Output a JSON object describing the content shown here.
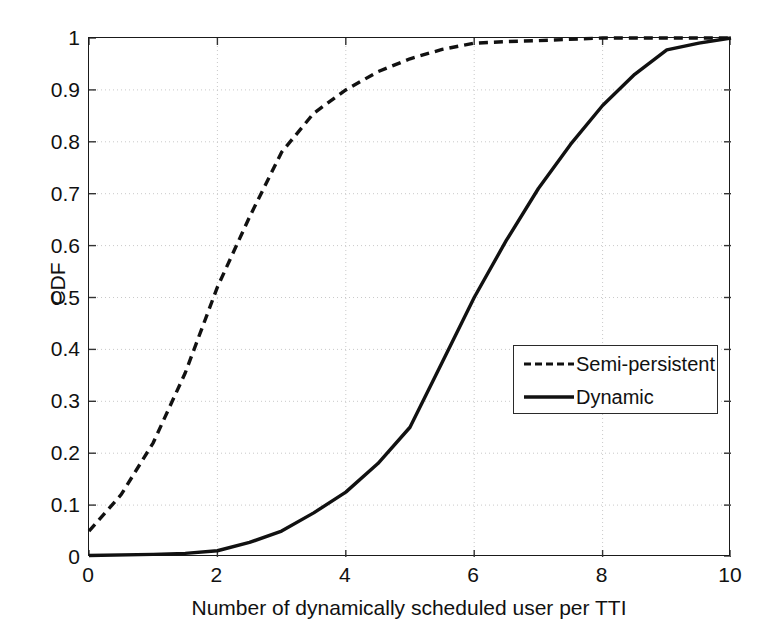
{
  "chart_data": {
    "type": "line",
    "title": "",
    "xlabel": "Number of dynamically scheduled user per TTI",
    "ylabel": "CDF",
    "xlim": [
      0,
      10
    ],
    "ylim": [
      0,
      1
    ],
    "grid": true,
    "grid_style": "dotted",
    "legend_position": "center-right",
    "xticks": [
      "0",
      "2",
      "4",
      "6",
      "8",
      "10"
    ],
    "xtick_values": [
      0,
      2,
      4,
      6,
      8,
      10
    ],
    "yticks": [
      "0",
      "0.1",
      "0.2",
      "0.3",
      "0.4",
      "0.5",
      "0.6",
      "0.7",
      "0.8",
      "0.9",
      "1"
    ],
    "ytick_values": [
      0,
      0.1,
      0.2,
      0.3,
      0.4,
      0.5,
      0.6,
      0.7,
      0.8,
      0.9,
      1.0
    ],
    "series": [
      {
        "name": "Semi-persistent",
        "style": "dashed",
        "color": "#111111",
        "x": [
          0,
          0.5,
          1,
          1.5,
          2,
          2.5,
          3,
          3.5,
          4,
          4.5,
          5,
          5.5,
          6,
          6.5,
          7,
          8,
          9,
          10
        ],
        "values": [
          0.05,
          0.12,
          0.22,
          0.355,
          0.52,
          0.655,
          0.78,
          0.855,
          0.9,
          0.935,
          0.96,
          0.978,
          0.99,
          0.993,
          0.995,
          1.0,
          1.0,
          1.0
        ]
      },
      {
        "name": "Dynamic",
        "style": "solid",
        "color": "#111111",
        "x": [
          0,
          1,
          1.5,
          2,
          2.5,
          3,
          3.5,
          4,
          4.5,
          5,
          5.5,
          6,
          6.5,
          7,
          7.5,
          8,
          8.5,
          9,
          9.5,
          10
        ],
        "values": [
          0.003,
          0.005,
          0.007,
          0.012,
          0.028,
          0.05,
          0.085,
          0.125,
          0.18,
          0.25,
          0.375,
          0.5,
          0.61,
          0.71,
          0.795,
          0.87,
          0.93,
          0.977,
          0.99,
          1.0
        ]
      }
    ]
  },
  "legend": {
    "items": [
      {
        "label": "Semi-persistent",
        "style": "dashed"
      },
      {
        "label": "Dynamic",
        "style": "solid"
      }
    ]
  }
}
